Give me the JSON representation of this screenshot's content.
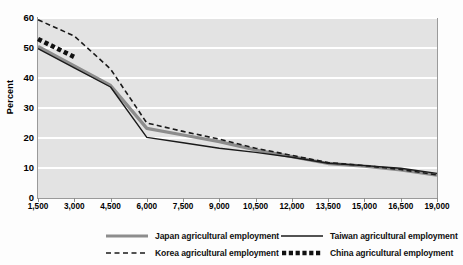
{
  "chart_data": {
    "type": "line",
    "title": "",
    "xlabel": "",
    "ylabel": "Percent",
    "xlim": [
      1500,
      19000
    ],
    "ylim": [
      0,
      60
    ],
    "grid": true,
    "legend_position": "bottom",
    "ytick_labels": [
      "60",
      "50",
      "40",
      "30",
      "20",
      "10",
      "0"
    ],
    "ytick_values": [
      60,
      50,
      40,
      30,
      20,
      10,
      0
    ],
    "xtick_labels": [
      "1,500",
      "3,000",
      "4,500",
      "6,000",
      "7,500",
      "9,000",
      "10,500",
      "12,000",
      "13,500",
      "15,000",
      "16,500",
      "19,000"
    ],
    "xtick_values": [
      1500,
      3000,
      4500,
      6000,
      7500,
      9000,
      10500,
      12000,
      13500,
      15000,
      16500,
      19000
    ],
    "series": [
      {
        "name": "Japan agricultural employment",
        "style": "solid-thick-gray",
        "color": "#8d8d8d",
        "x": [
          1500,
          3000,
          4500,
          6000,
          7500,
          9000,
          10500,
          12000,
          13500,
          15000,
          16500,
          19000
        ],
        "y": [
          50.5,
          44.0,
          37.5,
          23.2,
          21.0,
          18.8,
          16.0,
          13.8,
          11.5,
          10.6,
          9.4,
          7.6
        ]
      },
      {
        "name": "Taiwan agricultural employment",
        "style": "solid-thin-black",
        "color": "#1a1a1a",
        "x": [
          1500,
          3000,
          4500,
          6000,
          7500,
          9000,
          10500,
          12000,
          13500,
          15000,
          16500,
          19000
        ],
        "y": [
          49.8,
          43.4,
          37.0,
          20.2,
          18.4,
          16.6,
          15.2,
          13.6,
          11.6,
          10.8,
          9.9,
          8.2
        ]
      },
      {
        "name": "Korea agricultural employment",
        "style": "dashed-black",
        "color": "#1a1a1a",
        "x": [
          1500,
          3000,
          4500,
          6000,
          7500,
          9000,
          10500,
          12000,
          13500,
          15000,
          16500,
          19000
        ],
        "y": [
          59.4,
          54.0,
          43.0,
          25.0,
          22.2,
          19.6,
          16.6,
          14.2,
          11.8,
          10.8,
          9.5,
          7.7
        ]
      },
      {
        "name": "China agricultural employment",
        "style": "dotted-square-black",
        "color": "#111111",
        "x": [
          1500,
          2000,
          2500,
          3000
        ],
        "y": [
          53.0,
          51.0,
          49.0,
          47.0
        ]
      }
    ],
    "legend": [
      {
        "label": "Japan agricultural employment",
        "style": "solid-thick-gray"
      },
      {
        "label": "Korea agricultural employment",
        "style": "dashed-black"
      },
      {
        "label": "Taiwan agricultural employment",
        "style": "solid-thin-black"
      },
      {
        "label": "China agricultural employment",
        "style": "dotted-square-black"
      }
    ]
  }
}
